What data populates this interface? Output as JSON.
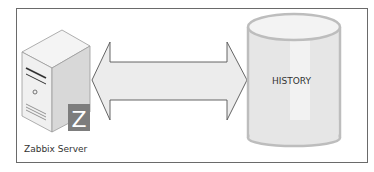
{
  "diagram": {
    "nodes": [
      {
        "id": "zabbix-server",
        "label": "Zabbix Server",
        "type": "server",
        "badge": "Z"
      },
      {
        "id": "history",
        "label": "HISTORY",
        "type": "database"
      }
    ],
    "edges": [
      {
        "from": "zabbix-server",
        "to": "history",
        "type": "bidirectional-arrow"
      }
    ],
    "colors": {
      "frame": "#6a6a6a",
      "arrow_fill": "#ececec",
      "arrow_stroke": "#555555",
      "cylinder_fill": "#e6e6e6",
      "cylinder_stroke": "#bdbdbd",
      "badge": "#7d7d7d"
    }
  }
}
